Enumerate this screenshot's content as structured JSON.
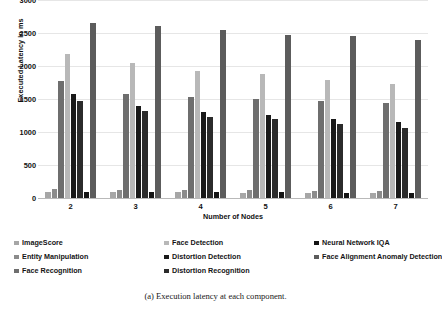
{
  "caption": "(a) Execution latency at each component.",
  "chart_data": {
    "type": "bar",
    "title": "",
    "xlabel": "Number of Nodes",
    "ylabel": "Executed Latency in ms",
    "categories": [
      "2",
      "3",
      "4",
      "5",
      "6",
      "7"
    ],
    "ylim": [
      0,
      3000
    ],
    "yticks": [
      0,
      500,
      1000,
      1500,
      2000,
      2500,
      3000
    ],
    "grid": true,
    "legend_position": "bottom",
    "series": [
      {
        "name": "ImageScore",
        "color": "#a6a6a6",
        "values": [
          95,
          90,
          85,
          80,
          78,
          75
        ]
      },
      {
        "name": "Entity Manipulation",
        "color": "#8c8c8c",
        "values": [
          130,
          125,
          120,
          115,
          110,
          108
        ]
      },
      {
        "name": "Face Recognition",
        "color": "#6e6e6e",
        "values": [
          1770,
          1575,
          1530,
          1500,
          1470,
          1435
        ]
      },
      {
        "name": "Face Detection",
        "color": "#b8b8b8",
        "values": [
          2175,
          2050,
          1930,
          1885,
          1790,
          1735
        ]
      },
      {
        "name": "Distortion Detection",
        "color": "#1a1a1a",
        "values": [
          1580,
          1395,
          1300,
          1255,
          1200,
          1145
        ]
      },
      {
        "name": "Distortion Recognition",
        "color": "#2b2b2b",
        "values": [
          1475,
          1325,
          1225,
          1195,
          1120,
          1060
        ]
      },
      {
        "name": "Neural Network IQA",
        "color": "#141414",
        "values": [
          95,
          90,
          88,
          85,
          82,
          80
        ]
      },
      {
        "name": "Face Alignment Anomaly Detection",
        "color": "#5c5c5c",
        "values": [
          2650,
          2600,
          2540,
          2475,
          2450,
          2395
        ]
      }
    ]
  }
}
